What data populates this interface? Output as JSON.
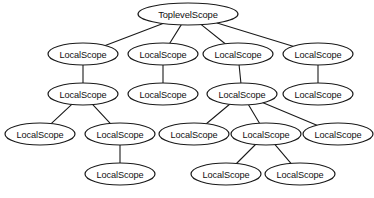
{
  "diagram": {
    "type": "tree",
    "canvas": {
      "width": 374,
      "height": 198
    },
    "style": {
      "node_shape": "ellipse",
      "node_fill": "#ffffff",
      "node_stroke": "#1a1a1a",
      "edge_stroke": "#1a1a1a",
      "background": "#ffffff"
    },
    "labels": {
      "root": "ToplevelScope",
      "local": "LocalScope"
    },
    "nodes": [
      {
        "id": "n0",
        "label": "ToplevelScope",
        "cx": 188,
        "cy": 14,
        "rx": 50,
        "ry": 11,
        "row": 0
      },
      {
        "id": "n1",
        "label": "LocalScope",
        "cx": 83,
        "cy": 54,
        "rx": 35,
        "ry": 11,
        "row": 1
      },
      {
        "id": "n2",
        "label": "LocalScope",
        "cx": 163,
        "cy": 54,
        "rx": 35,
        "ry": 11,
        "row": 1
      },
      {
        "id": "n3",
        "label": "LocalScope",
        "cx": 238,
        "cy": 54,
        "rx": 35,
        "ry": 11,
        "row": 1
      },
      {
        "id": "n4",
        "label": "LocalScope",
        "cx": 318,
        "cy": 54,
        "rx": 35,
        "ry": 11,
        "row": 1
      },
      {
        "id": "n5",
        "label": "LocalScope",
        "cx": 83,
        "cy": 94,
        "rx": 35,
        "ry": 11,
        "row": 2
      },
      {
        "id": "n6",
        "label": "LocalScope",
        "cx": 163,
        "cy": 94,
        "rx": 35,
        "ry": 11,
        "row": 2
      },
      {
        "id": "n7",
        "label": "LocalScope",
        "cx": 242,
        "cy": 94,
        "rx": 35,
        "ry": 11,
        "row": 2
      },
      {
        "id": "n8",
        "label": "LocalScope",
        "cx": 318,
        "cy": 94,
        "rx": 35,
        "ry": 11,
        "row": 2
      },
      {
        "id": "n9",
        "label": "LocalScope",
        "cx": 40,
        "cy": 134,
        "rx": 35,
        "ry": 11,
        "row": 3
      },
      {
        "id": "n10",
        "label": "LocalScope",
        "cx": 120,
        "cy": 134,
        "rx": 35,
        "ry": 11,
        "row": 3
      },
      {
        "id": "n11",
        "label": "LocalScope",
        "cx": 194,
        "cy": 134,
        "rx": 35,
        "ry": 11,
        "row": 3
      },
      {
        "id": "n12",
        "label": "LocalScope",
        "cx": 266,
        "cy": 134,
        "rx": 35,
        "ry": 11,
        "row": 3
      },
      {
        "id": "n13",
        "label": "LocalScope",
        "cx": 338,
        "cy": 134,
        "rx": 35,
        "ry": 11,
        "row": 3
      },
      {
        "id": "n14",
        "label": "LocalScope",
        "cx": 120,
        "cy": 174,
        "rx": 35,
        "ry": 11,
        "row": 4
      },
      {
        "id": "n15",
        "label": "LocalScope",
        "cx": 226,
        "cy": 174,
        "rx": 35,
        "ry": 11,
        "row": 4
      },
      {
        "id": "n16",
        "label": "LocalScope",
        "cx": 300,
        "cy": 174,
        "rx": 35,
        "ry": 11,
        "row": 4
      }
    ],
    "edges": [
      {
        "from": "n0",
        "to": "n1"
      },
      {
        "from": "n0",
        "to": "n2"
      },
      {
        "from": "n0",
        "to": "n3"
      },
      {
        "from": "n0",
        "to": "n4"
      },
      {
        "from": "n1",
        "to": "n5"
      },
      {
        "from": "n2",
        "to": "n6"
      },
      {
        "from": "n3",
        "to": "n7"
      },
      {
        "from": "n4",
        "to": "n8"
      },
      {
        "from": "n5",
        "to": "n9"
      },
      {
        "from": "n5",
        "to": "n10"
      },
      {
        "from": "n7",
        "to": "n11"
      },
      {
        "from": "n7",
        "to": "n12"
      },
      {
        "from": "n7",
        "to": "n13"
      },
      {
        "from": "n10",
        "to": "n14"
      },
      {
        "from": "n12",
        "to": "n15"
      },
      {
        "from": "n12",
        "to": "n16"
      }
    ]
  }
}
